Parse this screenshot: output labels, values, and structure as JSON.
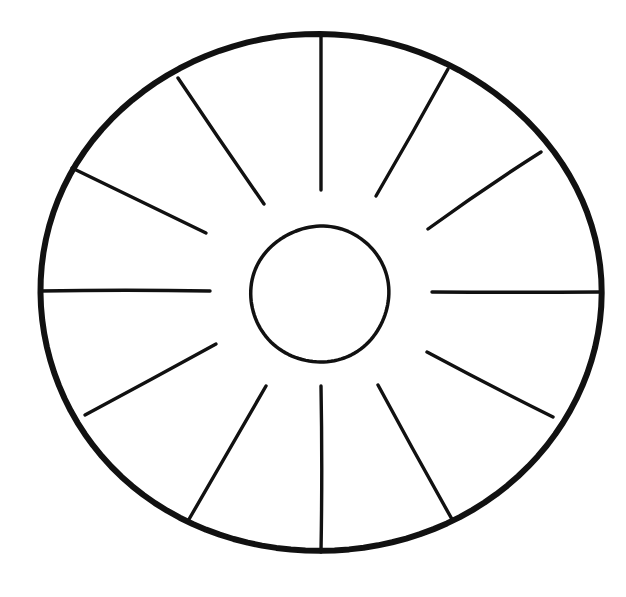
{
  "figure": {
    "background_color": "#ffffff",
    "ink_color": "#111111",
    "canvas": {
      "width": 626,
      "height": 597
    }
  },
  "outer_rim": {
    "name": "outer-circle",
    "center_x": 320,
    "center_y": 293,
    "radius_x": 280,
    "radius_y": 259,
    "stroke_width": 6,
    "color": "#111111"
  },
  "inner_hub": {
    "name": "inner-circle",
    "center_x": 320,
    "center_y": 294,
    "radius_x": 69,
    "radius_y": 68,
    "stroke_width": 3.5,
    "color": "#111111"
  },
  "spokes": {
    "count": 12,
    "angle_step_degrees": 30,
    "inner_gap_radius": 110,
    "stroke_width": 3.4,
    "color": "#111111",
    "items": [
      {
        "label": "spoke-000",
        "angle": 0,
        "x1": 321,
        "y1": 34,
        "x2": 321,
        "y2": 190
      },
      {
        "label": "spoke-030",
        "angle": 30,
        "x1": 448,
        "y1": 69,
        "x2": 376,
        "y2": 196
      },
      {
        "label": "spoke-060",
        "angle": 60,
        "x1": 541,
        "y1": 152,
        "x2": 428,
        "y2": 229
      },
      {
        "label": "spoke-090",
        "angle": 90,
        "x1": 600,
        "y1": 292,
        "x2": 432,
        "y2": 292
      },
      {
        "label": "spoke-120",
        "angle": 120,
        "x1": 553,
        "y1": 417,
        "x2": 427,
        "y2": 352
      },
      {
        "label": "spoke-150",
        "angle": 150,
        "x1": 453,
        "y1": 521,
        "x2": 378,
        "y2": 385
      },
      {
        "label": "spoke-180",
        "angle": 180,
        "x1": 321,
        "y1": 552,
        "x2": 321,
        "y2": 386
      },
      {
        "label": "spoke-210",
        "angle": 210,
        "x1": 188,
        "y1": 521,
        "x2": 266,
        "y2": 386
      },
      {
        "label": "spoke-240",
        "angle": 240,
        "x1": 85,
        "y1": 415,
        "x2": 216,
        "y2": 344
      },
      {
        "label": "spoke-270",
        "angle": 270,
        "x1": 40,
        "y1": 291,
        "x2": 210,
        "y2": 291
      },
      {
        "label": "spoke-300",
        "angle": 300,
        "x1": 72,
        "y1": 168,
        "x2": 206,
        "y2": 233
      },
      {
        "label": "spoke-330",
        "angle": 330,
        "x1": 178,
        "y1": 78,
        "x2": 264,
        "y2": 204
      }
    ]
  }
}
